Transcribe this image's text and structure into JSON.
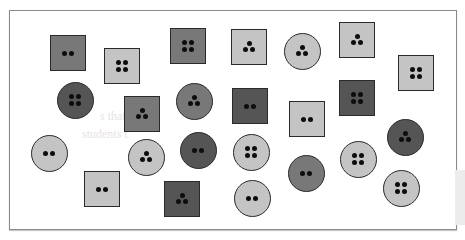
{
  "figure": {
    "colors": {
      "light": "#c4c4c4",
      "mid": "#787878",
      "dark": "#555555",
      "hole": "#0d0d0d",
      "border": "#2a2a2a"
    },
    "ghost_text": [
      "s that are di",
      "students t"
    ],
    "buttons": [
      {
        "id": 1,
        "shape": "square",
        "shade": "mid",
        "holes": 2,
        "cx": 68,
        "cy": 53,
        "size": 36
      },
      {
        "id": 2,
        "shape": "square",
        "shade": "light",
        "holes": 4,
        "cx": 122,
        "cy": 66,
        "size": 36
      },
      {
        "id": 3,
        "shape": "square",
        "shade": "mid",
        "holes": 4,
        "cx": 188,
        "cy": 46,
        "size": 36
      },
      {
        "id": 4,
        "shape": "square",
        "shade": "light",
        "holes": 3,
        "cx": 249,
        "cy": 47,
        "size": 36
      },
      {
        "id": 5,
        "shape": "circle",
        "shade": "light",
        "holes": 3,
        "cx": 302,
        "cy": 51,
        "size": 37
      },
      {
        "id": 6,
        "shape": "square",
        "shade": "light",
        "holes": 3,
        "cx": 357,
        "cy": 40,
        "size": 36
      },
      {
        "id": 7,
        "shape": "square",
        "shade": "light",
        "holes": 4,
        "cx": 416,
        "cy": 73,
        "size": 36
      },
      {
        "id": 8,
        "shape": "circle",
        "shade": "dark",
        "holes": 4,
        "cx": 75,
        "cy": 100,
        "size": 37
      },
      {
        "id": 9,
        "shape": "square",
        "shade": "mid",
        "holes": 3,
        "cx": 142,
        "cy": 114,
        "size": 36
      },
      {
        "id": 10,
        "shape": "circle",
        "shade": "mid",
        "holes": 3,
        "cx": 194,
        "cy": 101,
        "size": 37
      },
      {
        "id": 11,
        "shape": "square",
        "shade": "dark",
        "holes": 2,
        "cx": 250,
        "cy": 106,
        "size": 36
      },
      {
        "id": 12,
        "shape": "square",
        "shade": "light",
        "holes": 2,
        "cx": 307,
        "cy": 119,
        "size": 36
      },
      {
        "id": 13,
        "shape": "square",
        "shade": "dark",
        "holes": 4,
        "cx": 357,
        "cy": 98,
        "size": 36
      },
      {
        "id": 14,
        "shape": "circle",
        "shade": "dark",
        "holes": 3,
        "cx": 405,
        "cy": 137,
        "size": 37
      },
      {
        "id": 15,
        "shape": "circle",
        "shade": "light",
        "holes": 2,
        "cx": 49,
        "cy": 153,
        "size": 37
      },
      {
        "id": 16,
        "shape": "circle",
        "shade": "light",
        "holes": 3,
        "cx": 146,
        "cy": 157,
        "size": 37
      },
      {
        "id": 17,
        "shape": "circle",
        "shade": "dark",
        "holes": 2,
        "cx": 198,
        "cy": 150,
        "size": 37
      },
      {
        "id": 18,
        "shape": "circle",
        "shade": "light",
        "holes": 4,
        "cx": 251,
        "cy": 152,
        "size": 37
      },
      {
        "id": 19,
        "shape": "circle",
        "shade": "mid",
        "holes": 2,
        "cx": 306,
        "cy": 173,
        "size": 37
      },
      {
        "id": 20,
        "shape": "circle",
        "shade": "light",
        "holes": 4,
        "cx": 358,
        "cy": 159,
        "size": 37
      },
      {
        "id": 21,
        "shape": "square",
        "shade": "light",
        "holes": 2,
        "cx": 102,
        "cy": 189,
        "size": 36
      },
      {
        "id": 22,
        "shape": "square",
        "shade": "dark",
        "holes": 3,
        "cx": 182,
        "cy": 199,
        "size": 36
      },
      {
        "id": 23,
        "shape": "circle",
        "shade": "light",
        "holes": 2,
        "cx": 252,
        "cy": 198,
        "size": 37
      },
      {
        "id": 24,
        "shape": "circle",
        "shade": "light",
        "holes": 4,
        "cx": 401,
        "cy": 188,
        "size": 37
      }
    ]
  }
}
